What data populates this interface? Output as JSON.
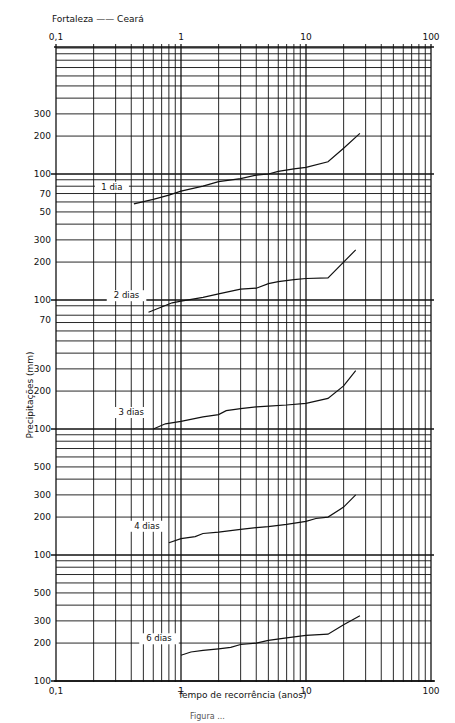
{
  "chart_data": {
    "type": "line",
    "xlabel": "Tempo de recorrência (anos)",
    "ylabel": "Precipitações (mm)",
    "x_scale": "log",
    "xlim": [
      0.1,
      100
    ],
    "x_ticks": [
      "0,1",
      "1",
      "10",
      "100"
    ],
    "grid": true,
    "panels": [
      {
        "name": "1 dia",
        "y_scale": "log",
        "y_ticks": [
          "300",
          "200",
          "100",
          "70",
          "50"
        ],
        "x": [
          0.42,
          0.6,
          0.8,
          1.0,
          1.5,
          2.0,
          3.0,
          4.0,
          5.0,
          6.0,
          8.0,
          10.0,
          15.0,
          20.0,
          27.0
        ],
        "values": [
          58,
          63,
          68,
          73,
          80,
          87,
          92,
          98,
          100,
          105,
          110,
          113,
          125,
          160,
          210
        ]
      },
      {
        "name": "2 dias",
        "y_scale": "log",
        "y_ticks": [
          "300",
          "200",
          "100",
          "70"
        ],
        "x": [
          0.55,
          0.7,
          0.85,
          1.0,
          1.5,
          2.0,
          3.0,
          4.0,
          5.0,
          6.0,
          8.0,
          10.0,
          15.0,
          20.0,
          25.0
        ],
        "values": [
          80,
          88,
          95,
          98,
          105,
          112,
          122,
          124,
          135,
          140,
          145,
          148,
          150,
          200,
          250
        ]
      },
      {
        "name": "3 dias",
        "y_scale": "log",
        "y_ticks": [
          "300",
          "200",
          "100"
        ],
        "x": [
          0.6,
          0.75,
          1.0,
          1.5,
          2.0,
          2.3,
          3.0,
          4.0,
          5.0,
          7.0,
          10.0,
          15.0,
          20.0,
          25.0
        ],
        "values": [
          100,
          110,
          115,
          125,
          130,
          140,
          145,
          150,
          152,
          155,
          160,
          175,
          220,
          290
        ]
      },
      {
        "name": "4 dias",
        "y_scale": "log",
        "y_ticks": [
          "500",
          "300",
          "200",
          "100"
        ],
        "x": [
          0.8,
          1.0,
          1.3,
          1.5,
          2.0,
          3.0,
          4.0,
          5.0,
          7.0,
          10.0,
          12.0,
          15.0,
          20.0,
          25.0
        ],
        "values": [
          125,
          135,
          140,
          148,
          152,
          160,
          165,
          168,
          175,
          185,
          195,
          200,
          240,
          300
        ]
      },
      {
        "name": "6 dias",
        "y_scale": "log",
        "y_ticks": [
          "500",
          "300",
          "200",
          "100"
        ],
        "x": [
          1.0,
          1.2,
          1.5,
          2.0,
          2.5,
          3.0,
          4.0,
          5.0,
          7.0,
          10.0,
          15.0,
          20.0,
          27.0
        ],
        "values": [
          160,
          170,
          175,
          180,
          185,
          195,
          200,
          210,
          220,
          230,
          235,
          280,
          330
        ]
      }
    ]
  },
  "labels": {
    "title": "Fortaleza —— Ceará",
    "xlabel": "Tempo de recorrência (anos)",
    "ylabel": "Precipitações (mm)",
    "caption": "Figura ..."
  }
}
